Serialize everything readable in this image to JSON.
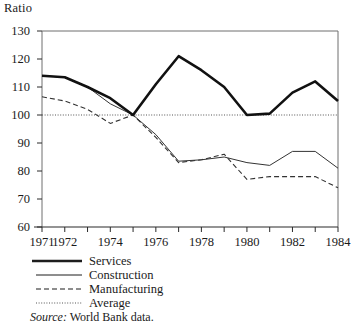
{
  "chart_data": {
    "type": "line",
    "title": "",
    "ylabel": "Ratio",
    "xlabel": "",
    "ylim": [
      60,
      130
    ],
    "xlim": [
      1971,
      1984
    ],
    "grid": false,
    "y_ticks": [
      60,
      70,
      80,
      90,
      100,
      110,
      120,
      130
    ],
    "x_ticks": [
      1971,
      1972,
      1973,
      1974,
      1975,
      1976,
      1977,
      1978,
      1979,
      1980,
      1981,
      1982,
      1983,
      1984
    ],
    "x_tick_labels": [
      "1971",
      "1972",
      "",
      "1974",
      "",
      "1976",
      "",
      "1978",
      "",
      "1980",
      "",
      "1982",
      "",
      "1984"
    ],
    "x": [
      1971,
      1972,
      1973,
      1974,
      1975,
      1976,
      1977,
      1978,
      1979,
      1980,
      1981,
      1982,
      1983,
      1984
    ],
    "legend_position": "below-plot",
    "series": [
      {
        "name": "Services",
        "style": "thick-solid",
        "color": "#111111",
        "values": [
          114,
          113.5,
          110,
          106,
          100,
          111,
          121,
          116,
          110,
          100,
          100.5,
          108,
          112,
          105
        ]
      },
      {
        "name": "Construction",
        "style": "thin-solid",
        "color": "#333333",
        "values": [
          114,
          113.5,
          110,
          104,
          100,
          93,
          83.5,
          84,
          85,
          83,
          82,
          87,
          87,
          81
        ]
      },
      {
        "name": "Manufacturing",
        "style": "dashed",
        "color": "#333333",
        "values": [
          106.5,
          105,
          102,
          97,
          100,
          92,
          83,
          84,
          86,
          77,
          78,
          78,
          78,
          74
        ]
      },
      {
        "name": "Average",
        "style": "dotted",
        "color": "#555555",
        "values": [
          100,
          100,
          100,
          100,
          100,
          100,
          100,
          100,
          100,
          100,
          100,
          100,
          100,
          100
        ]
      }
    ]
  },
  "legend": {
    "items": [
      {
        "label": "Services",
        "style": "thick-solid"
      },
      {
        "label": "Construction",
        "style": "thin-solid"
      },
      {
        "label": "Manufacturing",
        "style": "dashed"
      },
      {
        "label": "Average",
        "style": "dotted"
      }
    ]
  },
  "source": {
    "prefix": "Source:",
    "text": "World Bank data."
  }
}
